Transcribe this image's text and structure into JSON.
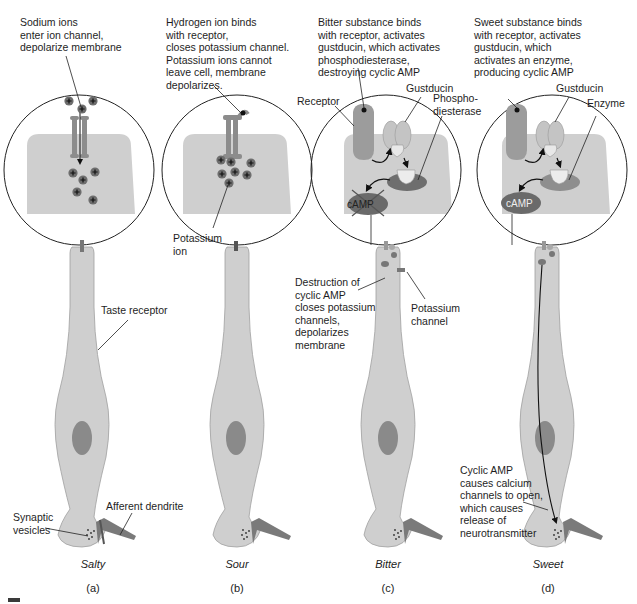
{
  "figure": {
    "panels": [
      {
        "id": "a",
        "letter": "(a)",
        "taste": "Salty",
        "description": "Sodium ions\nenter ion channel,\ndepolarize membrane",
        "labels": {
          "taste_receptor": "Taste receptor",
          "afferent_dendrite": "Afferent dendrite",
          "synaptic_vesicles": "Synaptic\nvesicles"
        }
      },
      {
        "id": "b",
        "letter": "(b)",
        "taste": "Sour",
        "description": "Hydrogen ion binds\nwith receptor,\ncloses potassium channel.\nPotassium ions cannot\nleave cell, membrane\ndepolarizes.",
        "labels": {
          "potassium_ion": "Potassium\nion"
        }
      },
      {
        "id": "c",
        "letter": "(c)",
        "taste": "Bitter",
        "description": "Bitter substance binds\nwith receptor, activates\ngustducin, which activates\nphosphodiesterase,\ndestroying cyclic AMP",
        "labels": {
          "receptor": "Receptor",
          "gustducin": "Gustducin",
          "phosphodiesterase": "Phospho-\ndiesterase",
          "camp": "cAMP",
          "destruction": "Destruction of\ncyclic AMP\ncloses potassium\nchannels,\ndepolarizes\nmembrane",
          "potassium_channel": "Potassium\nchannel"
        }
      },
      {
        "id": "d",
        "letter": "(d)",
        "taste": "Sweet",
        "description": "Sweet substance binds\nwith receptor, activates\ngustducin, which\nactivates an enzyme,\nproducing cyclic AMP",
        "labels": {
          "gustducin": "Gustducin",
          "enzyme": "Enzyme",
          "camp": "cAMP",
          "cyclic_amp_effect": "Cyclic AMP\ncauses calcium\nchannels to open,\nwhich causes\nrelease of\nneurotransmitter"
        }
      }
    ],
    "colors": {
      "cell_fill": "#cfcfcf",
      "cell_stroke": "#9a9a9a",
      "nucleus": "#8a8a8a",
      "channel": "#8c8c8c",
      "receptor": "#9c9c9c",
      "gustducin": "#c4c4c4",
      "pde": "#6e6e6e",
      "enzyme": "#8e8e8e",
      "camp": "#6a6a6a",
      "ion": "#6d6d6d"
    }
  }
}
